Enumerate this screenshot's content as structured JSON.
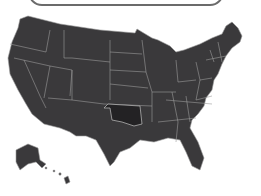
{
  "map": {
    "title": "United States",
    "highlighted_state": "Oklahoma",
    "colors": {
      "state_fill": "#3a393b",
      "highlight_fill": "#232224",
      "border": "#9a9a9a",
      "background": "#ffffff"
    }
  }
}
